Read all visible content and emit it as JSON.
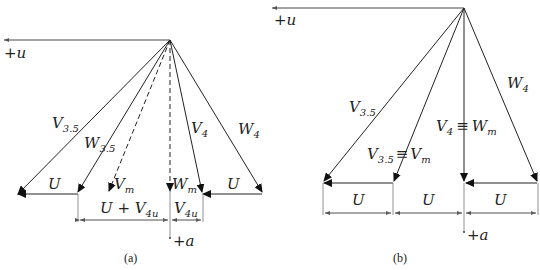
{
  "panels": [
    {
      "id": "a",
      "caption": "(a)",
      "axis_u_label": "+u",
      "axis_a_label": "+a",
      "labels": {
        "V35": {
          "main": "V",
          "sub": "3.5"
        },
        "W35": {
          "main": "W",
          "sub": "3.5"
        },
        "Vm": {
          "main": "V",
          "sub": "m"
        },
        "Wm": {
          "main": "W",
          "sub": "m"
        },
        "V4": {
          "main": "V",
          "sub": "4"
        },
        "W4": {
          "main": "W",
          "sub": "4"
        },
        "U_left": "U",
        "U_right": "U",
        "dim_left": {
          "main": "U + V",
          "sub": "4u"
        },
        "dim_right": {
          "main": "V",
          "sub": "4u"
        }
      }
    },
    {
      "id": "b",
      "caption": "(b)",
      "axis_u_label": "+u",
      "axis_a_label": "+a",
      "labels": {
        "V35": {
          "main": "V",
          "sub": "3.5"
        },
        "V35_eq_Vm": {
          "main1": "V",
          "sub1": "3.5",
          "eq": "≡",
          "main2": "V",
          "sub2": "m"
        },
        "V4_eq_Wm": {
          "main1": "V",
          "sub1": "4",
          "eq": "≡",
          "main2": "W",
          "sub2": "m"
        },
        "W4": {
          "main": "W",
          "sub": "4"
        },
        "U_left": "U",
        "U_right": "U",
        "dim_1": "U",
        "dim_2": "U",
        "dim_3": "U"
      }
    }
  ]
}
